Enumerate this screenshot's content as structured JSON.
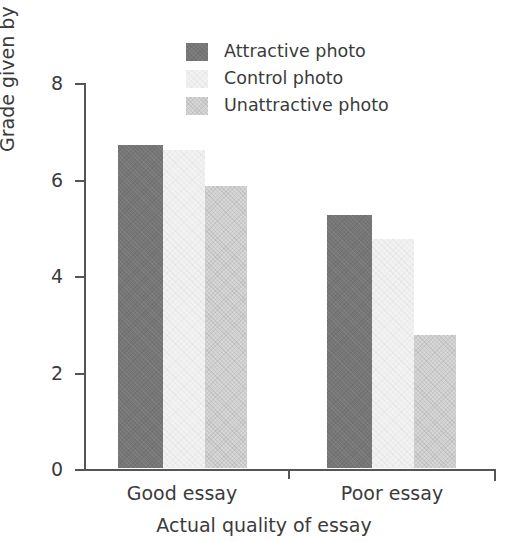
{
  "chart_data": {
    "type": "bar",
    "title": "",
    "subtitle": "",
    "xlabel": "Actual quality of essay",
    "ylabel": "Grade given by students",
    "categories": [
      "Good essay",
      "Poor essay"
    ],
    "series": [
      {
        "name": "Attractive photo",
        "values": [
          6.7,
          5.25
        ],
        "color": "#767676"
      },
      {
        "name": "Control photo",
        "values": [
          6.6,
          4.75
        ],
        "color": "#f2f2f2"
      },
      {
        "name": "Unattractive photo",
        "values": [
          5.85,
          2.75
        ],
        "color": "#d6d6d6"
      }
    ],
    "ylim": [
      0,
      8
    ],
    "yticks": [
      0,
      2,
      4,
      6,
      8
    ],
    "ytick_labels": [
      "0",
      "2",
      "4",
      "6",
      "8"
    ],
    "grid": false,
    "legend_position": "top-center"
  },
  "legend": {
    "items": [
      {
        "label": "Attractive photo",
        "swatch": "legend-swatch-attractive"
      },
      {
        "label": "Control photo",
        "swatch": "legend-swatch-control"
      },
      {
        "label": "Unattractive photo",
        "swatch": "legend-swatch-unattractive"
      }
    ]
  },
  "axes": {
    "y_title": "Grade given by students",
    "x_title": "Actual quality of essay",
    "y_ticks": [
      "8",
      "6",
      "4",
      "2",
      "0"
    ],
    "x_categories": [
      "Good essay",
      "Poor essay"
    ]
  }
}
